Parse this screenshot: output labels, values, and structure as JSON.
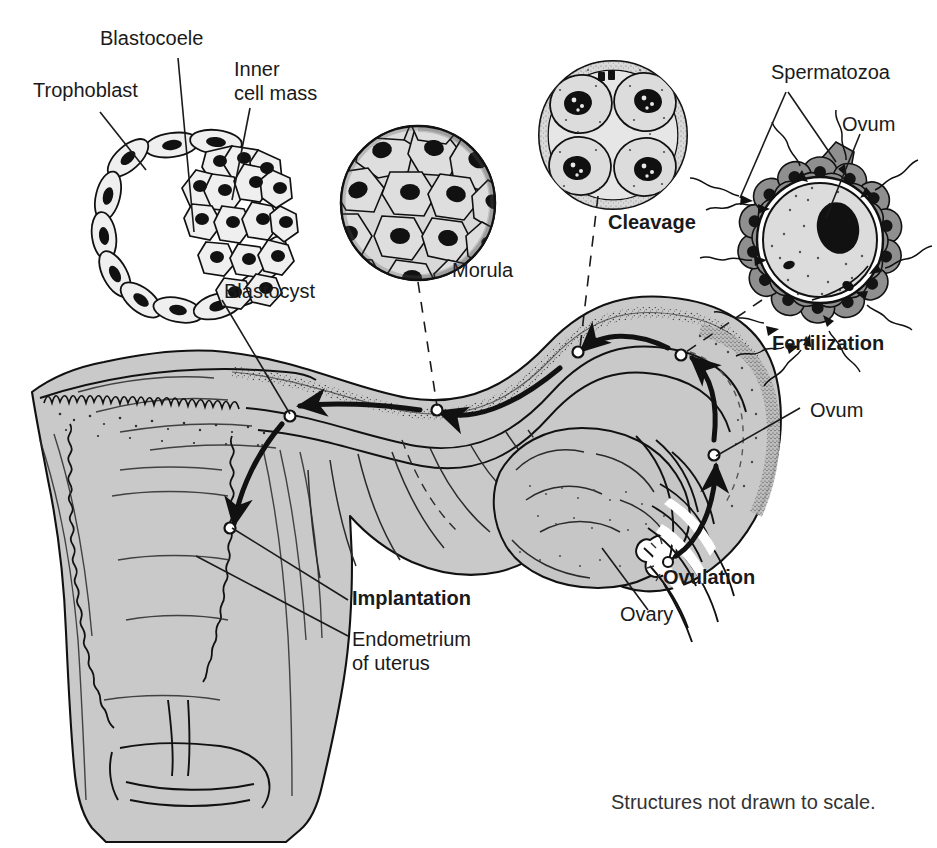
{
  "figure": {
    "caption": "Structures not drawn to scale.",
    "background_color": "#ffffff",
    "tissue_fill_color": "#c9c9c9",
    "line_color": "#1a1a1a",
    "text_color": "#1a1a1a"
  },
  "labels": {
    "trophoblast": "Trophoblast",
    "blastocoele": "Blastocoele",
    "inner_cell_mass_line1": "Inner",
    "inner_cell_mass_line2": "cell mass",
    "blastocyst": "Blastocyst",
    "morula": "Morula",
    "cleavage": "Cleavage",
    "spermatozoa": "Spermatozoa",
    "ovum_top": "Ovum",
    "fertilization": "Fertilization",
    "ovum_tube": "Ovum",
    "ovulation": "Ovulation",
    "ovary": "Ovary",
    "implantation": "Implantation",
    "endometrium_line1": "Endometrium",
    "endometrium_line2": "of uterus"
  },
  "stages": [
    {
      "id": "fertilization",
      "label": "Fertilization",
      "emphasis": "bold",
      "order": 1
    },
    {
      "id": "cleavage",
      "label": "Cleavage",
      "emphasis": "bold",
      "order": 2
    },
    {
      "id": "morula",
      "label": "Morula",
      "emphasis": "normal",
      "order": 3
    },
    {
      "id": "blastocyst",
      "label": "Blastocyst",
      "emphasis": "normal",
      "order": 4
    },
    {
      "id": "implantation",
      "label": "Implantation",
      "emphasis": "bold",
      "order": 5
    },
    {
      "id": "ovulation",
      "label": "Ovulation",
      "emphasis": "bold",
      "order": 0
    }
  ],
  "anatomy_parts": [
    "Endometrium of uterus",
    "Ovary",
    "Uterine (fallopian) tube",
    "Fimbriae",
    "Cervix"
  ],
  "insets": {
    "blastocyst": {
      "name": "blastocyst-inset",
      "parts": [
        "Trophoblast",
        "Blastocoele",
        "Inner cell mass"
      ],
      "cell_count_outer": 14
    },
    "morula": {
      "name": "morula-inset",
      "parts": [
        "Morula"
      ],
      "cell_count_visible": 40
    },
    "cleavage": {
      "name": "cleavage-inset",
      "parts": [
        "Cleavage"
      ],
      "cell_count": 4
    },
    "fertilization": {
      "name": "fertilization-inset",
      "parts": [
        "Spermatozoa",
        "Ovum"
      ],
      "corona_cell_count": 22,
      "sperm_count": 14
    }
  }
}
